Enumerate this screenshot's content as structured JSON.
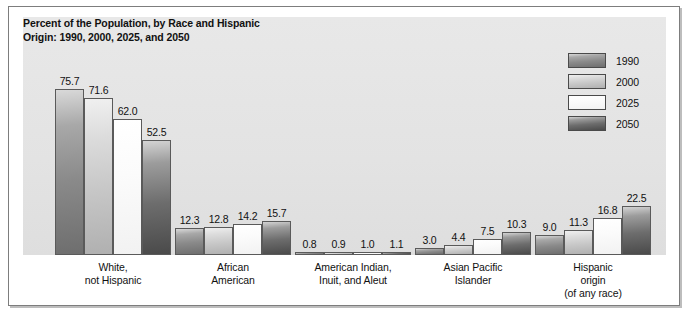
{
  "chart_data": {
    "type": "bar",
    "title": "Percent of the Population, by Race and Hispanic Origin: 1990, 2000, 2025, and 2050",
    "title_line1": "Percent of the Population, by Race and Hispanic",
    "title_line2": "Origin: 1990, 2000, 2025, and 2050",
    "xlabel": "",
    "ylabel": "",
    "ylim": [
      0,
      80
    ],
    "grid": false,
    "legend_position": "top-right",
    "categories": [
      "White, not Hispanic",
      "African American",
      "American Indian, Inuit, and Aleut",
      "Asian Pacific Islander",
      "Hispanic origin (of any race)"
    ],
    "category_lines": [
      [
        "White,",
        "not Hispanic"
      ],
      [
        "African",
        "American"
      ],
      [
        "American Indian,",
        "Inuit, and Aleut"
      ],
      [
        "Asian Pacific",
        "Islander"
      ],
      [
        "Hispanic",
        "origin",
        "(of any race)"
      ]
    ],
    "series": [
      {
        "name": "1990",
        "color": "#8a8a8a",
        "values": [
          75.7,
          12.3,
          0.8,
          3.0,
          9.0
        ]
      },
      {
        "name": "2000",
        "color": "#c6c6c6",
        "values": [
          71.6,
          12.8,
          0.9,
          4.4,
          11.3
        ]
      },
      {
        "name": "2025",
        "color": "#f7f7f7",
        "values": [
          62.0,
          14.2,
          1.0,
          7.5,
          16.8
        ]
      },
      {
        "name": "2050",
        "color": "#5a5a5a",
        "values": [
          52.5,
          15.7,
          1.1,
          10.3,
          22.5
        ]
      }
    ],
    "value_labels": [
      [
        "75.7",
        "71.6",
        "62.0",
        "52.5"
      ],
      [
        "12.3",
        "12.8",
        "14.2",
        "15.7"
      ],
      [
        "0.8",
        "0.9",
        "1.0",
        "1.1"
      ],
      [
        "3.0",
        "4.4",
        "7.5",
        "10.3"
      ],
      [
        "9.0",
        "11.3",
        "16.8",
        "22.5"
      ]
    ]
  },
  "legend": {
    "items": [
      {
        "label": "1990"
      },
      {
        "label": "2000"
      },
      {
        "label": "2025"
      },
      {
        "label": "2050"
      }
    ]
  }
}
